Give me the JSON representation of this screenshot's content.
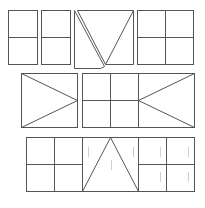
{
  "diagram": {
    "width": 205,
    "height": 208,
    "background": "#ffffff",
    "stroke_color": "#555555",
    "faint_color": "#cfcfcf",
    "rows": [
      {
        "name": "top-row",
        "shapes": [
          {
            "name": "rect-quartered-narrow-1",
            "rect": [
              8,
              10,
              29,
              54
            ],
            "lines": [
              [
                8,
                37,
                37,
                37
              ]
            ]
          },
          {
            "name": "rect-quartered-narrow-2",
            "rect": [
              41,
              10,
              29,
              54
            ],
            "lines": [
              [
                41,
                37,
                70,
                37
              ]
            ]
          },
          {
            "name": "split-triangle-square",
            "polylines": [
              [
                [
                  74,
                  10
                ],
                [
                  104,
                  66
                ],
                [
                  100,
                  68
                ],
                [
                  74,
                  68
                ],
                [
                  74,
                  12
                ],
                [
                  74,
                  10
                ]
              ],
              [
                [
                  77,
                  10
                ],
                [
                  133,
                  10
                ],
                [
                  105,
                  64
                ],
                [
                  77,
                  10
                ]
              ],
              [
                [
                  133,
                  10
                ],
                [
                  133,
                  64
                ],
                [
                  105,
                  64
                ]
              ]
            ]
          },
          {
            "name": "rect-quartered-square",
            "rect": [
              137,
              10,
              56,
              54
            ],
            "lines": [
              [
                165,
                10,
                165,
                64
              ],
              [
                137,
                37,
                193,
                37
              ]
            ]
          }
        ]
      },
      {
        "name": "middle-row",
        "shapes": [
          {
            "name": "rect-arrow-right",
            "rect": [
              21,
              73,
              56,
              54
            ],
            "lines": [
              [
                21,
                73,
                77,
                100
              ],
              [
                21,
                127,
                77,
                100
              ]
            ]
          },
          {
            "name": "rect-grid-with-arrow-left",
            "rect": [
              82,
              73,
              112,
              54
            ],
            "lines": [
              [
                110,
                73,
                110,
                127
              ],
              [
                138,
                73,
                138,
                127
              ],
              [
                82,
                100,
                138,
                100
              ],
              [
                138,
                100,
                194,
                73
              ],
              [
                138,
                100,
                194,
                127
              ]
            ]
          }
        ]
      },
      {
        "name": "bottom-row",
        "shapes": [
          {
            "name": "rect-strip",
            "rect": [
              26,
              137,
              168,
              54
            ],
            "lines": [
              [
                54,
                137,
                54,
                191
              ],
              [
                82,
                137,
                82,
                191
              ],
              [
                26,
                164,
                82,
                164
              ],
              [
                82,
                191,
                110,
                137
              ],
              [
                110,
                137,
                138,
                191
              ],
              [
                138,
                137,
                138,
                191
              ],
              [
                166,
                137,
                166,
                191
              ],
              [
                138,
                164,
                194,
                164
              ]
            ],
            "faint_marks": [
              [
                88,
                147,
                88,
                157
              ],
              [
                133,
                147,
                133,
                157
              ],
              [
                111,
                160,
                111,
                170
              ],
              [
                160,
                147,
                160,
                157
              ],
              [
                188,
                147,
                188,
                157
              ],
              [
                160,
                172,
                160,
                182
              ],
              [
                188,
                172,
                188,
                182
              ]
            ]
          }
        ]
      }
    ]
  }
}
